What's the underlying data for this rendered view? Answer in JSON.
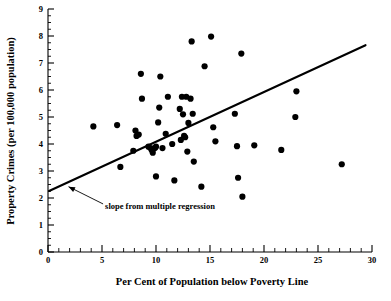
{
  "chart_data": {
    "type": "scatter",
    "title": "",
    "xlabel": "Per Cent of Population below Poverty Line",
    "ylabel": "Property Crimes (per 100,000 population)",
    "xlim": [
      0,
      30
    ],
    "ylim": [
      0,
      9
    ],
    "grid": false,
    "legend": null,
    "x_major_ticks": [
      0,
      5,
      10,
      15,
      20,
      25,
      30
    ],
    "x_major_tick_labels": [
      "0",
      "5",
      "10",
      "15",
      "20",
      "25",
      "30"
    ],
    "x_minor_tick_step": 1,
    "y_major_ticks": [
      0,
      1,
      2,
      3,
      4,
      5,
      6,
      7,
      8,
      9
    ],
    "y_major_tick_labels": [
      "0",
      "1",
      "2",
      "3",
      "4",
      "5",
      "6",
      "7",
      "8",
      "9"
    ],
    "y_minor_tick_step": 0.25,
    "marker": "filled-circle",
    "marker_color": "#000000",
    "marker_radius": 3.1,
    "points": [
      {
        "x": 4.2,
        "y": 4.65
      },
      {
        "x": 6.4,
        "y": 4.7
      },
      {
        "x": 6.7,
        "y": 3.15
      },
      {
        "x": 7.9,
        "y": 3.75
      },
      {
        "x": 8.1,
        "y": 4.5
      },
      {
        "x": 8.2,
        "y": 4.3
      },
      {
        "x": 8.4,
        "y": 4.35
      },
      {
        "x": 8.6,
        "y": 6.6
      },
      {
        "x": 8.7,
        "y": 5.68
      },
      {
        "x": 9.3,
        "y": 3.9
      },
      {
        "x": 9.5,
        "y": 3.85
      },
      {
        "x": 9.6,
        "y": 3.78
      },
      {
        "x": 9.7,
        "y": 3.68
      },
      {
        "x": 9.9,
        "y": 3.85
      },
      {
        "x": 10.0,
        "y": 3.9
      },
      {
        "x": 10.0,
        "y": 2.8
      },
      {
        "x": 10.2,
        "y": 4.8
      },
      {
        "x": 10.3,
        "y": 5.35
      },
      {
        "x": 10.4,
        "y": 6.5
      },
      {
        "x": 10.6,
        "y": 3.85
      },
      {
        "x": 10.9,
        "y": 4.38
      },
      {
        "x": 11.1,
        "y": 5.75
      },
      {
        "x": 11.5,
        "y": 4.0
      },
      {
        "x": 11.7,
        "y": 2.65
      },
      {
        "x": 12.2,
        "y": 5.3
      },
      {
        "x": 12.3,
        "y": 4.15
      },
      {
        "x": 12.4,
        "y": 5.75
      },
      {
        "x": 12.5,
        "y": 5.1
      },
      {
        "x": 12.6,
        "y": 4.3
      },
      {
        "x": 12.7,
        "y": 4.25
      },
      {
        "x": 12.8,
        "y": 5.75
      },
      {
        "x": 12.9,
        "y": 3.72
      },
      {
        "x": 13.0,
        "y": 4.78
      },
      {
        "x": 13.2,
        "y": 5.68
      },
      {
        "x": 13.3,
        "y": 7.8
      },
      {
        "x": 13.4,
        "y": 5.12
      },
      {
        "x": 13.5,
        "y": 3.35
      },
      {
        "x": 14.2,
        "y": 2.42
      },
      {
        "x": 14.5,
        "y": 6.88
      },
      {
        "x": 15.1,
        "y": 7.98
      },
      {
        "x": 15.3,
        "y": 4.62
      },
      {
        "x": 15.5,
        "y": 4.1
      },
      {
        "x": 17.3,
        "y": 5.12
      },
      {
        "x": 17.5,
        "y": 3.92
      },
      {
        "x": 17.6,
        "y": 2.75
      },
      {
        "x": 17.9,
        "y": 7.35
      },
      {
        "x": 18.0,
        "y": 2.05
      },
      {
        "x": 19.1,
        "y": 3.95
      },
      {
        "x": 21.6,
        "y": 3.78
      },
      {
        "x": 22.9,
        "y": 5.0
      },
      {
        "x": 23.0,
        "y": 5.95
      },
      {
        "x": 27.2,
        "y": 3.25
      }
    ],
    "regression_line": {
      "label": "slope from multiple regression",
      "x_start": 0.1,
      "y_start": 2.26,
      "x_end": 29.4,
      "y_end": 7.66
    },
    "annotation": {
      "text": "slope from multiple regression",
      "arrow_from_x": 5.1,
      "arrow_from_y": 1.78,
      "arrow_to_x": 1.9,
      "arrow_to_y": 2.42
    }
  }
}
